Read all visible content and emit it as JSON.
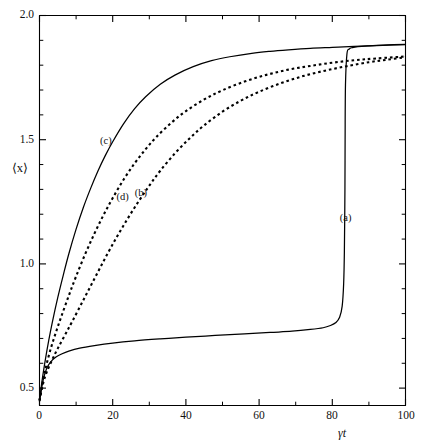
{
  "chart_data": {
    "type": "line",
    "title": "",
    "subtitle": "",
    "xlabel": "γt",
    "ylabel": "⟨x⟩",
    "xlim": [
      0,
      100
    ],
    "ylim": [
      0.43,
      2.0
    ],
    "grid": false,
    "legend_position": "inline-annotations",
    "xticks": [
      0,
      20,
      40,
      60,
      80,
      100
    ],
    "xticklabels": [
      "0",
      "20",
      "40",
      "60",
      "80",
      "100"
    ],
    "xminorticks": [
      10,
      30,
      50,
      70,
      90
    ],
    "yticks": [
      0.5,
      1.0,
      1.5,
      2.0
    ],
    "yticklabels": [
      "0.5",
      "1.0",
      "1.5",
      "2.0"
    ],
    "yminorticks": [
      0.6,
      0.7,
      0.8,
      0.9,
      1.1,
      1.2,
      1.3,
      1.4,
      1.6,
      1.7,
      1.8,
      1.9
    ],
    "series": [
      {
        "name": "(a)",
        "style": "solid",
        "color": "#000000",
        "label_x": 84.5,
        "label_y": 1.18,
        "x": [
          0,
          0.6,
          1.2,
          2,
          3,
          4.5,
          6,
          8,
          11,
          15,
          20,
          26,
          33,
          40,
          48,
          56,
          63,
          69,
          74,
          77.5,
          79.5,
          81,
          82,
          82.7,
          83.1,
          83.3,
          83.45,
          83.5,
          83.6,
          84,
          84.6,
          85.5,
          87,
          90,
          94,
          100
        ],
        "y": [
          0.445,
          0.5,
          0.545,
          0.58,
          0.605,
          0.625,
          0.637,
          0.649,
          0.661,
          0.671,
          0.681,
          0.69,
          0.698,
          0.705,
          0.712,
          0.718,
          0.724,
          0.729,
          0.736,
          0.743,
          0.752,
          0.764,
          0.785,
          0.83,
          0.92,
          1.05,
          1.3,
          1.5,
          1.72,
          1.845,
          1.865,
          1.871,
          1.875,
          1.878,
          1.881,
          1.884
        ]
      },
      {
        "name": "(b)",
        "style": "dashed",
        "color": "#000000",
        "label_x": 28.5,
        "label_y": 1.28,
        "x": [
          0,
          1,
          2,
          3.5,
          5,
          7,
          9,
          12,
          15,
          18,
          21,
          24,
          27,
          30,
          33,
          37,
          41,
          45,
          50,
          55,
          60,
          66,
          72,
          78,
          84,
          90,
          95,
          100
        ],
        "y": [
          0.45,
          0.52,
          0.565,
          0.615,
          0.66,
          0.715,
          0.77,
          0.855,
          0.94,
          1.025,
          1.105,
          1.18,
          1.25,
          1.315,
          1.375,
          1.445,
          1.505,
          1.558,
          1.613,
          1.657,
          1.693,
          1.728,
          1.756,
          1.778,
          1.796,
          1.812,
          1.822,
          1.832
        ]
      },
      {
        "name": "(c)",
        "style": "solid",
        "color": "#000000",
        "label_x": 19,
        "label_y": 1.49,
        "x": [
          0,
          0.8,
          1.6,
          2.5,
          3.5,
          5,
          6.5,
          8,
          10,
          12,
          14,
          16,
          18,
          20,
          23,
          26,
          29,
          33,
          37,
          42,
          47,
          52,
          58,
          63,
          68,
          74,
          80,
          86,
          92,
          100
        ],
        "y": [
          0.45,
          0.54,
          0.615,
          0.69,
          0.765,
          0.865,
          0.955,
          1.04,
          1.14,
          1.228,
          1.305,
          1.375,
          1.437,
          1.492,
          1.565,
          1.625,
          1.673,
          1.723,
          1.76,
          1.794,
          1.818,
          1.834,
          1.848,
          1.856,
          1.862,
          1.868,
          1.872,
          1.876,
          1.879,
          1.883
        ]
      },
      {
        "name": "(d)",
        "style": "dashed",
        "color": "#000000",
        "label_x": 23.5,
        "label_y": 1.265,
        "x": [
          0,
          1,
          2,
          3.2,
          4.5,
          6,
          8,
          10,
          12.5,
          15,
          17.5,
          20,
          23,
          26,
          29,
          32,
          36,
          40,
          45,
          50,
          56,
          62,
          68,
          74,
          80,
          86,
          92,
          100
        ],
        "y": [
          0.45,
          0.535,
          0.6,
          0.665,
          0.725,
          0.79,
          0.872,
          0.95,
          1.04,
          1.122,
          1.197,
          1.265,
          1.34,
          1.405,
          1.462,
          1.512,
          1.568,
          1.615,
          1.662,
          1.699,
          1.734,
          1.761,
          1.782,
          1.797,
          1.81,
          1.82,
          1.827,
          1.835
        ]
      }
    ]
  },
  "axes": {
    "y_axis_label": "⟨x⟩",
    "x_axis_label": "γt",
    "y_tick_labels": [
      "2.0",
      "1.5",
      "1.0",
      "0.5"
    ],
    "x_tick_labels": [
      "0",
      "20",
      "40",
      "60",
      "80",
      "100"
    ]
  },
  "annotations": [
    {
      "text": "(a)"
    },
    {
      "text": "(b)"
    },
    {
      "text": "(c)"
    },
    {
      "text": "(d)"
    }
  ]
}
